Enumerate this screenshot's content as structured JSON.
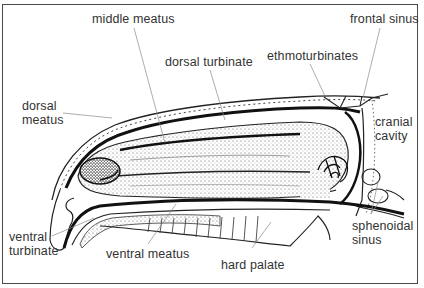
{
  "figure": {
    "type": "anatomical-diagram",
    "labels": {
      "middle_meatus": "middle meatus",
      "frontal_sinus": "frontal sinus",
      "dorsal_turbinate": "dorsal turbinate",
      "ethmoturbinates": "ethmoturbinates",
      "dorsal_meatus_1": "dorsal",
      "dorsal_meatus_2": "meatus",
      "cranial_cavity_1": "cranial",
      "cranial_cavity_2": "cavity",
      "ventral_turbinate_1": "ventral",
      "ventral_turbinate_2": "turbinate",
      "ventral_meatus": "ventral meatus",
      "hard_palate": "hard palate",
      "sphenoidal_sinus_1": "sphenoidal",
      "sphenoidal_sinus_2": "sinus"
    }
  }
}
